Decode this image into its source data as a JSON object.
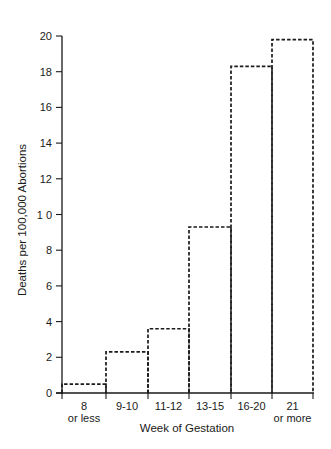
{
  "chart_data": {
    "type": "bar",
    "title": "",
    "xlabel": "Week of Gestation",
    "ylabel": "Deaths per 100,000 Abortions",
    "categories": [
      "8 or less",
      "9-10",
      "11-12",
      "13-15",
      "16-20",
      "21 or more"
    ],
    "category_lines": [
      [
        "8",
        "or less"
      ],
      [
        "9-10"
      ],
      [
        "11-12"
      ],
      [
        "13-15"
      ],
      [
        "16-20"
      ],
      [
        "21",
        "or more"
      ]
    ],
    "values": [
      0.5,
      2.3,
      3.6,
      9.3,
      18.3,
      19.8
    ],
    "ylim": [
      0,
      20
    ],
    "yticks": [
      0,
      2,
      4,
      6,
      8,
      10,
      12,
      14,
      16,
      18,
      20
    ],
    "ytick_labels": [
      "0",
      "2",
      "4",
      "6",
      "8",
      "1 0",
      "12",
      "14",
      "16",
      "18",
      "20"
    ],
    "grid": false,
    "legend": null,
    "bar_style": "dashed outline, no fill"
  },
  "colors": {
    "ink": "#1a1a1a",
    "background": "#ffffff"
  }
}
